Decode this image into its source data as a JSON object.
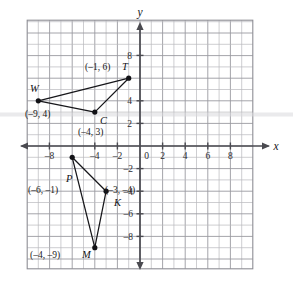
{
  "chart_data": {
    "type": "scatter",
    "title": "",
    "xlabel": "x",
    "ylabel": "y",
    "xlim": [
      -10,
      10
    ],
    "ylim": [
      -10,
      10
    ],
    "grid": true,
    "grid_step": 1,
    "legend": "none",
    "x_ticks": [
      {
        "value": -8,
        "label": "–8"
      },
      {
        "value": -4,
        "label": "–4"
      },
      {
        "value": -2,
        "label": "–2"
      },
      {
        "value": 0,
        "label": "0"
      },
      {
        "value": 2,
        "label": "2"
      },
      {
        "value": 4,
        "label": "4"
      },
      {
        "value": 6,
        "label": "6"
      },
      {
        "value": 8,
        "label": "8"
      }
    ],
    "y_ticks": [
      {
        "value": 8,
        "label": "8"
      },
      {
        "value": 4,
        "label": "4"
      },
      {
        "value": 2,
        "label": "2"
      },
      {
        "value": -2,
        "label": "–2"
      },
      {
        "value": -4,
        "label": "–4"
      },
      {
        "value": -6,
        "label": "–6"
      },
      {
        "value": -8,
        "label": "–8"
      }
    ],
    "shapes": [
      {
        "name": "triangle-WCT",
        "closed": true,
        "vertices": [
          {
            "id": "W",
            "x": -9,
            "y": 4
          },
          {
            "id": "C",
            "x": -4,
            "y": 3
          },
          {
            "id": "T",
            "x": -1,
            "y": 6
          }
        ]
      },
      {
        "name": "triangle-PKM",
        "closed": true,
        "vertices": [
          {
            "id": "P",
            "x": -6,
            "y": -1
          },
          {
            "id": "K",
            "x": -3,
            "y": -4
          },
          {
            "id": "M",
            "x": -4,
            "y": -9
          }
        ]
      }
    ],
    "points": [
      {
        "id": "W",
        "x": -9,
        "y": 4,
        "vertex_label": "W",
        "coord_label": "(–9, 4)"
      },
      {
        "id": "C",
        "x": -4,
        "y": 3,
        "vertex_label": "C",
        "coord_label": "(–4, 3)"
      },
      {
        "id": "T",
        "x": -1,
        "y": 6,
        "vertex_label": "T",
        "coord_label": "(–1, 6)"
      },
      {
        "id": "P",
        "x": -6,
        "y": -1,
        "vertex_label": "P",
        "coord_label": "(–6, –1)"
      },
      {
        "id": "K",
        "x": -3,
        "y": -4,
        "vertex_label": "K",
        "coord_label": "(–3, –4)"
      },
      {
        "id": "M",
        "x": -4,
        "y": -9,
        "vertex_label": "M",
        "coord_label": "(–4, –9)"
      }
    ]
  },
  "axes": {
    "x_axis_name": "x",
    "y_axis_name": "y",
    "origin_label": "0"
  },
  "labels": {
    "W_vertex": "W",
    "W_coord": "(–9, 4)",
    "C_vertex": "C",
    "C_coord": "(–4, 3)",
    "T_vertex": "T",
    "T_coord": "(–1, 6)",
    "P_vertex": "P",
    "P_coord": "(–6, –1)",
    "K_vertex": "K",
    "K_coord": "(–3, –4)",
    "M_vertex": "M",
    "M_coord": "(–4, –9)"
  },
  "ticks": {
    "x_neg8": "–8",
    "x_neg4": "–4",
    "x_neg2": "–2",
    "x_0": "0",
    "x_2": "2",
    "x_4": "4",
    "x_6": "6",
    "x_8": "8",
    "y_8": "8",
    "y_4": "4",
    "y_2": "2",
    "y_neg2": "–2",
    "y_neg4": "–4",
    "y_neg6": "–6",
    "y_neg8": "–8"
  },
  "colors": {
    "grid": "#b9b9bd",
    "axis": "#4a4a50",
    "shape_stroke": "#16161a",
    "vertex_fill": "#121216",
    "background": "#ffffff"
  }
}
